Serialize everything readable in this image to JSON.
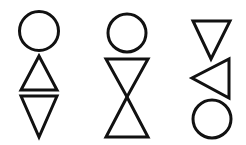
{
  "figures": [
    {
      "id": "figure-1",
      "shapes": [
        {
          "type": "circle"
        },
        {
          "type": "triangle",
          "orientation": "up"
        },
        {
          "type": "triangle",
          "orientation": "down"
        }
      ]
    },
    {
      "id": "figure-2",
      "shapes": [
        {
          "type": "circle"
        },
        {
          "type": "triangle",
          "orientation": "down"
        },
        {
          "type": "triangle",
          "orientation": "up"
        }
      ]
    },
    {
      "id": "figure-3",
      "shapes": [
        {
          "type": "triangle",
          "orientation": "down"
        },
        {
          "type": "triangle",
          "orientation": "left"
        },
        {
          "type": "circle"
        }
      ]
    }
  ],
  "stroke_color": "#111111"
}
